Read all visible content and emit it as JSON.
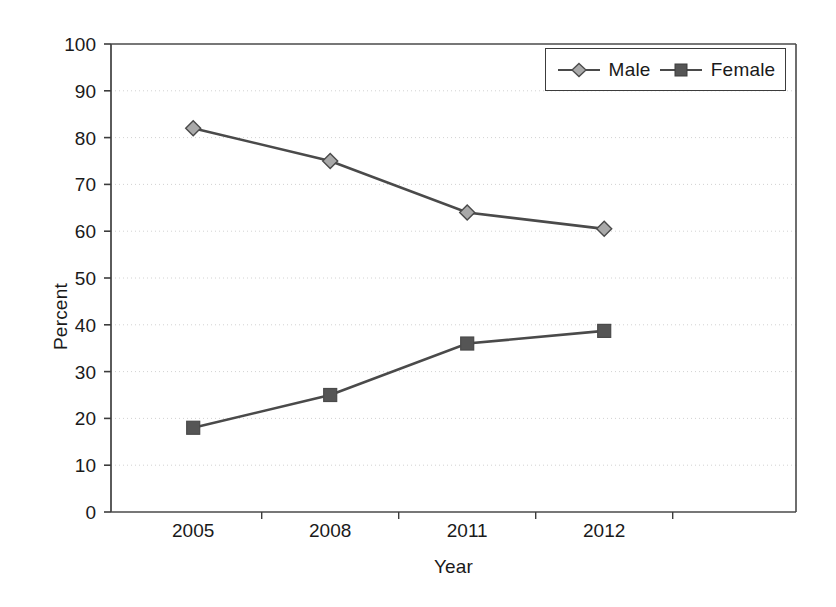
{
  "chart_data": {
    "type": "line",
    "title": "",
    "xlabel": "Year",
    "ylabel": "Percent",
    "categories": [
      "2005",
      "2008",
      "2011",
      "2012"
    ],
    "series": [
      {
        "name": "Male",
        "values": [
          82,
          75,
          64,
          60.5
        ],
        "marker": "diamond",
        "marker_color": "#a9a9a9",
        "line_color": "#4a4a4a"
      },
      {
        "name": "Female",
        "values": [
          18,
          25,
          36,
          38.7
        ],
        "marker": "square",
        "marker_color": "#555555",
        "line_color": "#4a4a4a"
      }
    ],
    "ylim": [
      0,
      100
    ],
    "yticks": [
      0,
      10,
      20,
      30,
      40,
      50,
      60,
      70,
      80,
      90,
      100
    ],
    "ytick_labels": [
      "0",
      "10",
      "20",
      "30",
      "40",
      "50",
      "60",
      "70",
      "80",
      "90",
      "100"
    ],
    "grid": "horizontal-dotted",
    "legend_position": "top-right",
    "legend_entries": [
      "Male",
      "Female"
    ]
  },
  "colors": {
    "line": "#4a4a4a",
    "male_marker": "#a9a9a9",
    "female_marker": "#555555",
    "axis": "#3c3c3c",
    "grid": "#d2d2d2",
    "background": "#ffffff",
    "text": "#1a1a1a"
  }
}
